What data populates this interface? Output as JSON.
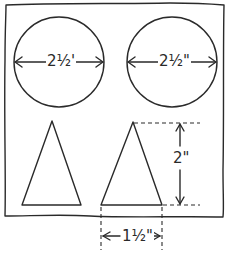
{
  "diagram": {
    "stroke_color": "#2a2a2a",
    "background_color": "#ffffff",
    "shapes": [
      {
        "type": "circle",
        "name": "left-circle",
        "dimension_label": "2½'"
      },
      {
        "type": "circle",
        "name": "right-circle",
        "dimension_label": "2½\""
      },
      {
        "type": "triangle",
        "name": "left-triangle"
      },
      {
        "type": "triangle",
        "name": "right-triangle",
        "height_label": "2\"",
        "base_label": "1½\""
      }
    ],
    "labels": {
      "circle_left_diameter": "2½'",
      "circle_right_diameter": "2½\"",
      "triangle_height": "2\"",
      "triangle_base": "1½\""
    }
  }
}
